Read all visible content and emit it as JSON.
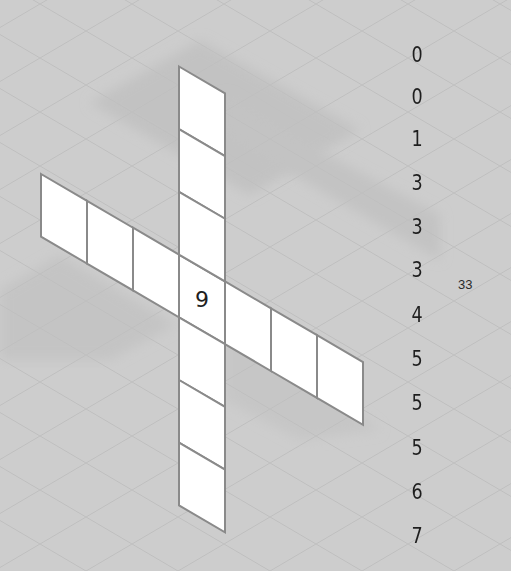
{
  "puzzle": {
    "type": "isometric-cross-grid",
    "horizontal_cells": 7,
    "vertical_cells": 7,
    "given_cells": [
      {
        "row": 3,
        "col": 3,
        "value": "9"
      }
    ],
    "number_list": [
      "0",
      "0",
      "1",
      "3",
      "3",
      "3",
      "4",
      "5",
      "5",
      "5",
      "6",
      "7"
    ],
    "total_label": "33"
  },
  "colors": {
    "background": "#cdcdcd",
    "cell_fill": "#ffffff",
    "cell_border": "#8a8a8a",
    "shadow": "#bdbdbd",
    "text": "#1e1e1e"
  }
}
